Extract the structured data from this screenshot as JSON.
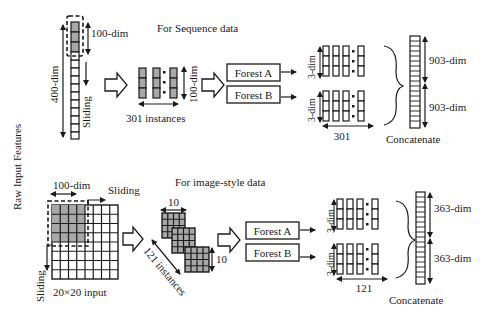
{
  "side_label": "Raw Input Features",
  "sequence": {
    "title": "For Sequence data",
    "input_dim_label": "400-dim",
    "window_dim_label": "100-dim",
    "sliding_label": "Sliding",
    "instances_label": "301 instances",
    "instance_dim_label": "100-dim",
    "forest_a": "Forest A",
    "forest_b": "Forest B",
    "out_a_dim": "3-dim",
    "out_b_dim": "3-dim",
    "count_label": "301",
    "concat_top_dim": "903-dim",
    "concat_bottom_dim": "903-dim",
    "concat_label": "Concatenate"
  },
  "image": {
    "title": "For image-style data",
    "window_dim_label": "100-dim",
    "sliding_h_label": "Sliding",
    "sliding_v_label": "Sliding",
    "input_label": "20×20 input",
    "patch_width_label": "10",
    "patch_height_label": "10",
    "instances_label": "121 instances",
    "forest_a": "Forest A",
    "forest_b": "Forest B",
    "out_a_dim": "3-dim",
    "out_b_dim": "3-dim",
    "count_label": "121",
    "concat_top_dim": "363-dim",
    "concat_bottom_dim": "363-dim",
    "concat_label": "Concatenate"
  }
}
